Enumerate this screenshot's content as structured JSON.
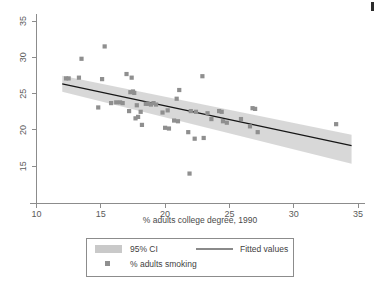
{
  "chart_data": {
    "type": "scatter",
    "title": "",
    "xlabel": "% adults college degree, 1990",
    "ylabel": "",
    "xlim": [
      10,
      35
    ],
    "ylim": [
      13,
      36.5
    ],
    "xticks": [
      10,
      15,
      20,
      25,
      30,
      35
    ],
    "yticks": [
      15,
      20,
      25,
      30,
      35
    ],
    "grid": false,
    "legend_position": "below-plot",
    "series": [
      {
        "name": "% adults smoking",
        "type": "scatter",
        "marker": "square",
        "color": "#8f8f8f",
        "points": [
          [
            12.3,
            27.1
          ],
          [
            12.5,
            27.1
          ],
          [
            13.3,
            27.2
          ],
          [
            13.5,
            29.8
          ],
          [
            14.8,
            23.1
          ],
          [
            15.1,
            27.0
          ],
          [
            15.3,
            31.5
          ],
          [
            15.8,
            23.7
          ],
          [
            16.2,
            23.8
          ],
          [
            16.5,
            23.8
          ],
          [
            16.7,
            23.7
          ],
          [
            17.0,
            27.7
          ],
          [
            17.2,
            22.6
          ],
          [
            17.3,
            25.2
          ],
          [
            17.4,
            27.2
          ],
          [
            17.5,
            25.3
          ],
          [
            17.6,
            25.1
          ],
          [
            17.7,
            21.6
          ],
          [
            17.8,
            23.4
          ],
          [
            17.9,
            21.8
          ],
          [
            18.1,
            22.5
          ],
          [
            18.2,
            20.7
          ],
          [
            18.5,
            23.6
          ],
          [
            18.7,
            23.6
          ],
          [
            18.9,
            23.5
          ],
          [
            19.1,
            23.7
          ],
          [
            19.3,
            23.5
          ],
          [
            19.8,
            22.4
          ],
          [
            20.0,
            20.3
          ],
          [
            20.2,
            22.7
          ],
          [
            20.3,
            20.2
          ],
          [
            20.7,
            21.3
          ],
          [
            20.9,
            24.3
          ],
          [
            21.0,
            21.2
          ],
          [
            21.1,
            25.5
          ],
          [
            21.8,
            19.7
          ],
          [
            22.0,
            22.6
          ],
          [
            22.3,
            18.8
          ],
          [
            22.4,
            22.5
          ],
          [
            22.9,
            27.4
          ],
          [
            23.0,
            18.9
          ],
          [
            23.3,
            22.3
          ],
          [
            23.6,
            21.5
          ],
          [
            24.2,
            22.6
          ],
          [
            24.4,
            22.5
          ],
          [
            24.5,
            21.2
          ],
          [
            24.8,
            21.0
          ],
          [
            25.9,
            21.5
          ],
          [
            26.6,
            20.5
          ],
          [
            26.8,
            23.0
          ],
          [
            27.0,
            22.9
          ],
          [
            27.2,
            19.7
          ],
          [
            33.3,
            20.8
          ],
          [
            21.9,
            14.0
          ]
        ]
      },
      {
        "name": "Fitted values",
        "type": "line",
        "color": "#161616",
        "endpoints": [
          [
            12.0,
            26.35
          ],
          [
            34.5,
            17.85
          ]
        ]
      },
      {
        "name": "95% CI",
        "type": "band",
        "color": "#c9c9c9",
        "upper": [
          [
            12.0,
            27.45
          ],
          [
            34.5,
            19.35
          ]
        ],
        "lower": [
          [
            12.0,
            25.25
          ],
          [
            34.5,
            15.35
          ]
        ]
      }
    ]
  },
  "legend": {
    "ci_label": "95% CI",
    "fitted_label": "Fitted values",
    "scatter_label": "% adults smoking"
  },
  "axes": {
    "x_title": "% adults college degree, 1990",
    "x_tick_labels": [
      "10",
      "15",
      "20",
      "25",
      "30",
      "35"
    ],
    "y_tick_labels": [
      "15",
      "20",
      "25",
      "30",
      "35"
    ]
  },
  "colors": {
    "marker": "#8f8f8f",
    "band": "#c9c9c9",
    "line": "#161616",
    "axis": "#8c8c8c",
    "background": "#ffffff"
  }
}
